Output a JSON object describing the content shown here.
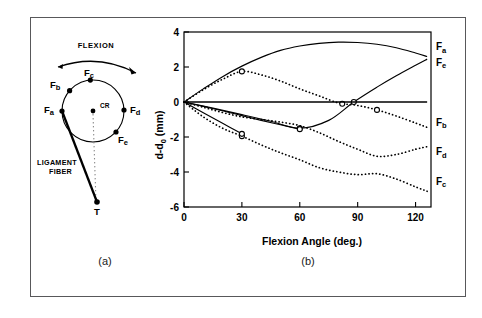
{
  "figure": {
    "panels": [
      {
        "id": "a",
        "caption": "(a)"
      },
      {
        "id": "b",
        "caption": "(b)"
      }
    ]
  },
  "diagram": {
    "flexion_label": "FLEXION",
    "center_label": "CR",
    "fiber_label_line1": "LIGAMENT",
    "fiber_label_line2": "FIBER",
    "tibia_label": "T",
    "attachment_points": [
      {
        "name": "Fa",
        "base": "F",
        "sub": "a",
        "angle_deg": 180
      },
      {
        "name": "Fb",
        "base": "F",
        "sub": "b",
        "angle_deg": 139
      },
      {
        "name": "Fc",
        "base": "F",
        "sub": "c",
        "angle_deg": 95
      },
      {
        "name": "Fd",
        "base": "F",
        "sub": "d",
        "angle_deg": 2
      },
      {
        "name": "Fe",
        "base": "F",
        "sub": "e",
        "angle_deg": -42
      }
    ]
  },
  "chart_data": {
    "type": "line",
    "title": "",
    "xlabel": "Flexion Angle (deg.)",
    "ylabel": "d-d0 (mm)",
    "ylabel_base": "d-d",
    "ylabel_sub": "0",
    "ylabel_unit": " (mm)",
    "xlim": [
      0,
      128
    ],
    "ylim": [
      -6,
      4
    ],
    "xticks": [
      0,
      30,
      60,
      90,
      120
    ],
    "xtick_labels": [
      "0",
      "30",
      "60",
      "90",
      "120"
    ],
    "yticks": [
      4,
      2,
      0,
      -2,
      -4,
      -6
    ],
    "ytick_labels": [
      "4",
      "2",
      "0",
      "-2",
      "-4",
      "-6"
    ],
    "grid": false,
    "legend_position": "right-inline",
    "series": [
      {
        "name": "Fa",
        "base": "F",
        "sub": "a",
        "style": "solid",
        "label_x": 129,
        "label_y": 3.15,
        "x": [
          0,
          10,
          20,
          30,
          40,
          50,
          60,
          70,
          80,
          90,
          100,
          110,
          120,
          126
        ],
        "y": [
          0.0,
          0.75,
          1.45,
          2.05,
          2.55,
          2.95,
          3.2,
          3.35,
          3.42,
          3.4,
          3.3,
          3.1,
          2.8,
          2.6
        ],
        "markers": []
      },
      {
        "name": "Fe",
        "base": "F",
        "sub": "e",
        "style": "solid",
        "label_x": 129,
        "label_y": 2.25,
        "x": [
          0,
          15,
          30,
          45,
          60,
          75,
          88,
          100,
          110,
          120,
          126
        ],
        "y": [
          0.0,
          -0.35,
          -0.72,
          -1.1,
          -1.5,
          -1.05,
          0.0,
          0.85,
          1.5,
          2.1,
          2.45
        ],
        "markers": [
          {
            "x": 60,
            "y": -1.5
          },
          {
            "x": 88,
            "y": 0.0
          }
        ]
      },
      {
        "name": "Fb",
        "base": "F",
        "sub": "b",
        "style": "dotted",
        "label_x": 129,
        "label_y": -1.15,
        "x": [
          0,
          10,
          20,
          30,
          40,
          50,
          60,
          70,
          80,
          90,
          100,
          110,
          120,
          126
        ],
        "y": [
          0.0,
          0.7,
          1.3,
          1.75,
          1.55,
          1.2,
          0.75,
          0.35,
          -0.05,
          -0.2,
          -0.45,
          -0.8,
          -1.2,
          -1.45
        ],
        "markers": [
          {
            "x": 30,
            "y": 1.75
          },
          {
            "x": 82,
            "y": -0.1
          },
          {
            "x": 100,
            "y": -0.45
          }
        ]
      },
      {
        "name": "Fd",
        "base": "F",
        "sub": "d",
        "style": "dotted",
        "label_x": 129,
        "label_y": -2.85,
        "x": [
          0,
          10,
          20,
          30,
          40,
          50,
          60,
          70,
          80,
          90,
          100,
          110,
          120,
          126
        ],
        "y": [
          0.0,
          -0.3,
          -0.6,
          -0.85,
          -1.0,
          -1.15,
          -1.35,
          -1.75,
          -2.25,
          -2.7,
          -3.1,
          -3.0,
          -2.7,
          -2.55
        ],
        "markers": []
      },
      {
        "name": "Fc",
        "base": "F",
        "sub": "c",
        "style": "dotted",
        "label_x": 129,
        "label_y": -4.55,
        "x": [
          0,
          10,
          20,
          30,
          40,
          50,
          60,
          70,
          80,
          90,
          100,
          110,
          120,
          126
        ],
        "y": [
          0.0,
          -0.85,
          -1.5,
          -1.95,
          -2.45,
          -2.9,
          -3.3,
          -3.75,
          -4.0,
          -4.15,
          -4.1,
          -4.4,
          -4.85,
          -5.1
        ],
        "markers": [
          {
            "x": 30,
            "y": -1.95
          }
        ]
      },
      {
        "name": "Fd-lower-branch",
        "base": "F",
        "sub": "",
        "style": "solid-short",
        "label_x": null,
        "label_y": null,
        "x": [
          0,
          10,
          20,
          30,
          40,
          50,
          60
        ],
        "y": [
          0.0,
          -0.25,
          -0.5,
          -0.78,
          -1.05,
          -1.3,
          -1.55
        ],
        "markers": [
          {
            "x": 60,
            "y": -1.55
          }
        ]
      },
      {
        "name": "Fc-lower-branch",
        "base": "F",
        "sub": "",
        "style": "solid-short",
        "label_x": null,
        "label_y": null,
        "x": [
          0,
          10,
          20,
          30
        ],
        "y": [
          0.0,
          -0.62,
          -1.22,
          -1.82
        ],
        "markers": [
          {
            "x": 30,
            "y": -1.82
          }
        ]
      },
      {
        "name": "zero-line",
        "base": "",
        "sub": "",
        "style": "baseline",
        "label_x": null,
        "label_y": null,
        "x": [
          0,
          126
        ],
        "y": [
          0.0,
          0.0
        ],
        "markers": []
      }
    ]
  }
}
